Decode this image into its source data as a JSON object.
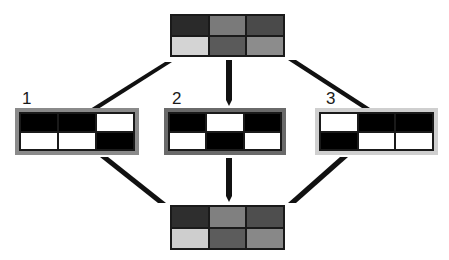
{
  "diagram": {
    "type": "grid-pattern-combination",
    "top_grid": {
      "cells": [
        "#2a2a2a",
        "#7a7a7a",
        "#4a4a4a",
        "#d4d4d4",
        "#5a5a5a",
        "#8c8c8c"
      ]
    },
    "bottom_grid": {
      "cells": [
        "#2e2e2e",
        "#808080",
        "#4e4e4e",
        "#cecece",
        "#5c5c5c",
        "#888888"
      ]
    },
    "patterns": [
      {
        "label": "1",
        "frame_color": "#8a8a8a",
        "cells": [
          "#000000",
          "#000000",
          "#ffffff",
          "#ffffff",
          "#ffffff",
          "#000000"
        ]
      },
      {
        "label": "2",
        "frame_color": "#6a6a6a",
        "cells": [
          "#000000",
          "#ffffff",
          "#000000",
          "#ffffff",
          "#000000",
          "#ffffff"
        ]
      },
      {
        "label": "3",
        "frame_color": "#cfcfcf",
        "cells": [
          "#ffffff",
          "#000000",
          "#000000",
          "#000000",
          "#ffffff",
          "#ffffff"
        ]
      }
    ],
    "arrow_color": "#111111"
  }
}
